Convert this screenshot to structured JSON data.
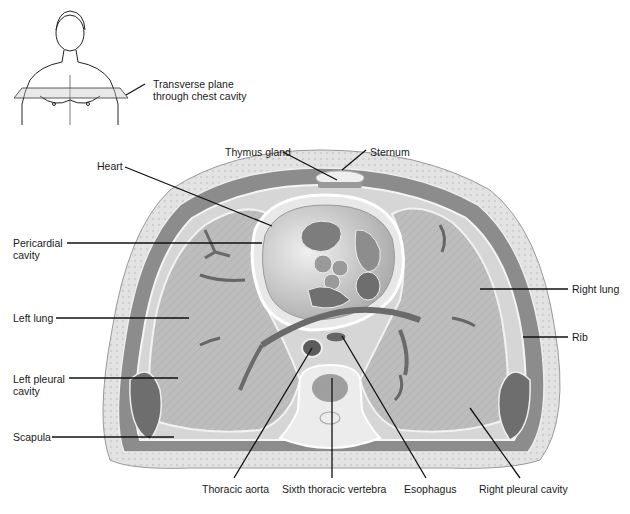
{
  "figure": {
    "type": "anatomical-cross-section"
  },
  "inset": {
    "label_line1": "Transverse plane",
    "label_line2": "through chest cavity"
  },
  "labels": {
    "thymus_gland": "Thymus gland",
    "sternum": "Sternum",
    "heart": "Heart",
    "pericardial_cavity_1": "Pericardial",
    "pericardial_cavity_2": "cavity",
    "left_lung": "Left lung",
    "left_pleural_cavity_1": "Left pleural",
    "left_pleural_cavity_2": "cavity",
    "scapula": "Scapula",
    "right_lung": "Right lung",
    "rib": "Rib",
    "thoracic_aorta": "Thoracic aorta",
    "sixth_thoracic_vertebra": "Sixth thoracic vertebra",
    "esophagus": "Esophagus",
    "right_pleural_cavity": "Right pleural cavity"
  },
  "colors": {
    "skin": "#d9d9d9",
    "fat": "#e6e6e6",
    "muscle": "#7a7a7a",
    "lung": "#b8b8b8",
    "heart": "#cfcfcf",
    "chamber": "#8a8a8a",
    "bone": "#efefef",
    "leader": "#111111"
  }
}
